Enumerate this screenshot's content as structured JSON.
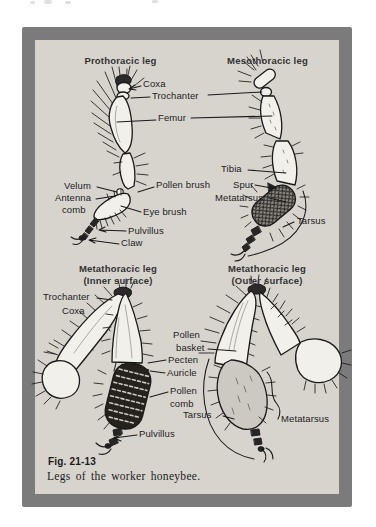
{
  "palette": {
    "page_bg": "#ffffff",
    "frame": "#7b7b7b",
    "panel": "#d7d4ce",
    "ink": "#1a1a1a"
  },
  "figure": {
    "caption_number": "Fig. 21-13",
    "caption_text": "Legs of the worker honeybee.",
    "titles": {
      "prothoracic": "Prothoracic leg",
      "mesothoracic": "Mesothoracic leg",
      "metathoracic_inner_1": "Metathoracic leg",
      "metathoracic_inner_2": "(Inner surface)",
      "metathoracic_outer_1": "Metathoracic leg",
      "metathoracic_outer_2": "(Outer surface)"
    },
    "labels": {
      "coxa_front": "Coxa",
      "trochanter_front": "Trochanter",
      "femur": "Femur",
      "velum": "Velum",
      "antenna_comb_line1": "Antenna",
      "antenna_comb_line2": "comb",
      "pollen_brush": "Pollen brush",
      "eye_brush": "Eye brush",
      "pulvillus_front": "Pulvillus",
      "claw": "Claw",
      "tibia": "Tibia",
      "spur": "Spur",
      "metatarsus_middle": "Metatarsus",
      "tarsus_middle": "Tarsus",
      "trochanter_hind": "Trochanter",
      "coxa_hind": "Coxa",
      "pollen_basket_line1": "Pollen",
      "pollen_basket_line2": "basket",
      "pecten": "Pecten",
      "auricle": "Auricle",
      "pollen_comb_line1": "Pollen",
      "pollen_comb_line2": "comb",
      "tarsus_hind": "Tarsus",
      "pulvillus_hind": "Pulvillus",
      "metatarsus_hind": "Metatarsus"
    }
  }
}
